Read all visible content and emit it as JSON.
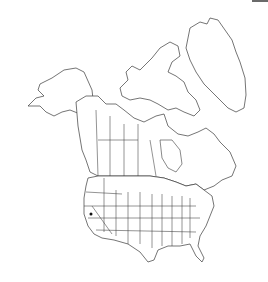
{
  "map": {
    "type": "distribution-map",
    "region": "North America",
    "regions_shown": [
      "Alaska",
      "Canada",
      "Greenland",
      "United States (contiguous)",
      "Mexico (northern edge)"
    ],
    "style": {
      "outline_color": "#3a3a3a",
      "fill_color": "#ffffff",
      "marker_color": "#111111"
    },
    "occurrences": [
      {
        "label": "California",
        "x": 91,
        "y": 214
      }
    ]
  },
  "corner_bar": {
    "color": "#6a6a6a"
  }
}
